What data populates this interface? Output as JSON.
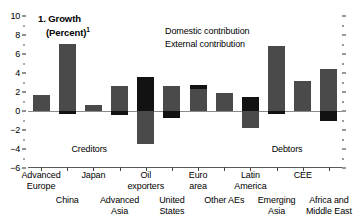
{
  "chart_data": {
    "type": "bar",
    "title": "1. Growth",
    "subtitle": "(Percent)",
    "title_footnote": "1",
    "xlabel": "",
    "ylabel": "",
    "ylim": [
      -6,
      10
    ],
    "yticks": [
      10,
      8,
      6,
      4,
      2,
      0,
      -2,
      -4,
      -6
    ],
    "ytick_labels": [
      "10",
      "8",
      "6",
      "4",
      "2",
      "0",
      "−2",
      "−4",
      "−6"
    ],
    "grid": false,
    "stacked": true,
    "legend_position": "top-center",
    "categories": [
      "Advanced\nEurope",
      "China",
      "Japan",
      "Advanced\nAsia",
      "Oil\nexporters",
      "United\nStates",
      "Euro\narea",
      "Other AEs",
      "Latin\nAmerica",
      "Emerging\nAsia",
      "CEE",
      "Africa and\nMiddle East"
    ],
    "series": [
      {
        "name": "Domestic contribution",
        "color": "#4a4a4a",
        "values": [
          1.7,
          7.1,
          0.65,
          2.65,
          -3.5,
          2.6,
          2.3,
          1.9,
          -1.8,
          6.8,
          3.2,
          4.4
        ]
      },
      {
        "name": "External contribution",
        "color": "#121212",
        "values": [
          0.0,
          -0.35,
          0.0,
          -0.45,
          3.6,
          -0.7,
          0.45,
          0.0,
          1.5,
          -0.3,
          0.0,
          -1.05
        ]
      }
    ],
    "annotations": [
      {
        "text": "Creditors",
        "x_category_span": [
          0,
          4
        ],
        "y": -4.0
      },
      {
        "text": "Debtors",
        "x_category_span": [
          8,
          11
        ],
        "y": -4.0
      }
    ]
  },
  "legend": {
    "items": [
      {
        "label": "Domestic contribution",
        "color": "#4a4a4a"
      },
      {
        "label": "External contribution",
        "color": "#121212"
      }
    ]
  }
}
